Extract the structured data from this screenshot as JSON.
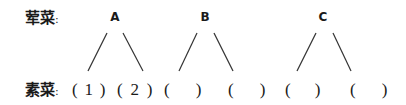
{
  "diagram": {
    "top_row": {
      "label": "荤菜",
      "colon": ":",
      "nodes": [
        {
          "id": "A",
          "label": "A"
        },
        {
          "id": "B",
          "label": "B"
        },
        {
          "id": "C",
          "label": "C"
        }
      ]
    },
    "bottom_row": {
      "label": "素菜",
      "colon": ":",
      "slots": [
        {
          "parent": "A",
          "value": "1"
        },
        {
          "parent": "A",
          "value": "2"
        },
        {
          "parent": "B",
          "value": ""
        },
        {
          "parent": "B",
          "value": ""
        },
        {
          "parent": "C",
          "value": ""
        },
        {
          "parent": "C",
          "value": ""
        }
      ]
    },
    "line_color": "#333333"
  }
}
